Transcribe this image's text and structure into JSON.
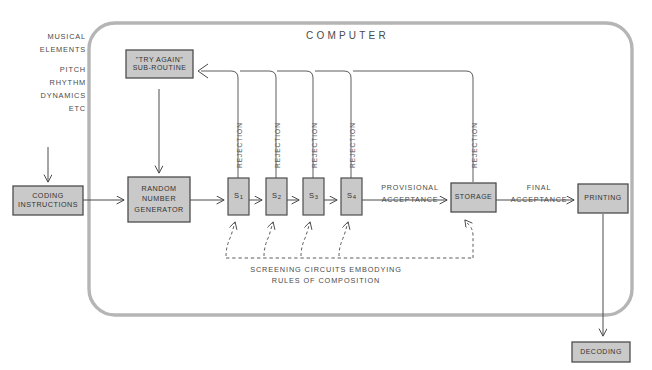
{
  "figure": {
    "domain_type": "flow-diagram",
    "background": "#ffffff",
    "ink": "#4a4a4a",
    "box_fill": "#c9c9c9",
    "box_stroke": "#4d4d4d",
    "enclosure_stroke": "#b0b0b0"
  },
  "enclosure": {
    "title": "COMPUTER"
  },
  "inputs": {
    "heading_line1": "MUSICAL",
    "heading_line2": "ELEMENTS",
    "items": [
      "PITCH",
      "RHYTHM",
      "DYNAMICS",
      "ETC"
    ]
  },
  "boxes": {
    "coding": {
      "line1": "CODING",
      "line2": "INSTRUCTIONS"
    },
    "try_again": {
      "line1": "\"TRY AGAIN\"",
      "line2": "SUB-ROUTINE"
    },
    "rng": {
      "line1": "RANDOM",
      "line2": "NUMBER",
      "line3": "GENERATOR"
    },
    "storage": {
      "label": "STORAGE"
    },
    "printing": {
      "label": "PRINTING"
    },
    "decoding": {
      "label": "DECODING"
    }
  },
  "screens": [
    {
      "id": "s1",
      "label": "S",
      "sub": "1",
      "rejection": "REJECTION"
    },
    {
      "id": "s2",
      "label": "S",
      "sub": "2",
      "rejection": "REJECTION"
    },
    {
      "id": "s3",
      "label": "S",
      "sub": "3",
      "rejection": "REJECTION"
    },
    {
      "id": "s4",
      "label": "S",
      "sub": "4",
      "rejection": "REJECTION"
    }
  ],
  "storage_rejection": "REJECTION",
  "edge_labels": {
    "provisional_line1": "PROVISIONAL",
    "provisional_line2": "ACCEPTANCE",
    "final_line1": "FINAL",
    "final_line2": "ACCEPTANCE"
  },
  "caption": {
    "line1": "SCREENING CIRCUITS EMBODYING",
    "line2": "RULES OF COMPOSITION"
  }
}
